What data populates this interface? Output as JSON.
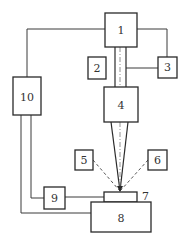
{
  "diagram": {
    "type": "block-diagram",
    "colors": {
      "stroke": "#2a2a2a",
      "background": "#ffffff",
      "text": "#333333"
    },
    "components": [
      {
        "id": "1",
        "label": "1"
      },
      {
        "id": "2",
        "label": "2"
      },
      {
        "id": "3",
        "label": "3"
      },
      {
        "id": "4",
        "label": "4"
      },
      {
        "id": "5",
        "label": "5"
      },
      {
        "id": "6",
        "label": "6"
      },
      {
        "id": "7",
        "label": "7"
      },
      {
        "id": "8",
        "label": "8"
      },
      {
        "id": "9",
        "label": "9"
      },
      {
        "id": "10",
        "label": "10"
      }
    ],
    "connections": [
      {
        "from": "1",
        "to": "10",
        "style": "solid"
      },
      {
        "from": "1",
        "to": "3",
        "style": "solid"
      },
      {
        "from": "3",
        "to": "beam-tube",
        "style": "solid"
      },
      {
        "from": "1",
        "to": "4",
        "style": "beam-tube"
      },
      {
        "from": "4",
        "to": "7",
        "style": "focused-beam"
      },
      {
        "from": "5",
        "to": "focal-point",
        "style": "dashed"
      },
      {
        "from": "6",
        "to": "focal-point",
        "style": "dashed"
      },
      {
        "from": "10",
        "to": "9",
        "style": "solid"
      },
      {
        "from": "9",
        "to": "7",
        "style": "solid"
      },
      {
        "from": "10",
        "to": "8",
        "style": "solid"
      }
    ]
  }
}
